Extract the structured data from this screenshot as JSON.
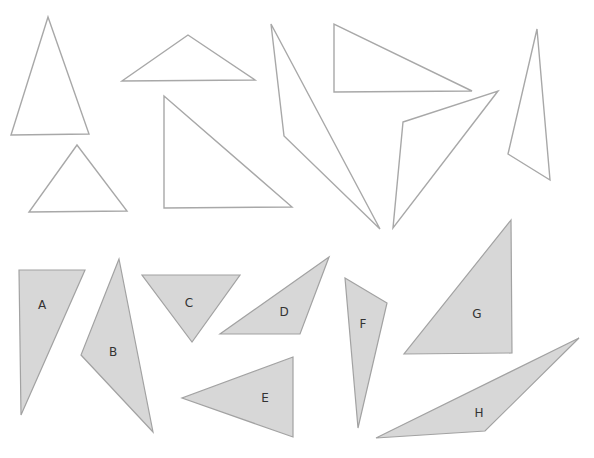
{
  "colors": {
    "background": "#ffffff",
    "outline_stroke": "#a8a8a8",
    "shape_fill": "#d7d7d7",
    "shape_stroke": "#a2a2a2",
    "label": "#333333"
  },
  "outline_triangles": [
    {
      "id": "outline-1",
      "points": "48,17 11,135 89,134"
    },
    {
      "id": "outline-2",
      "points": "77,145 29,212 127,211"
    },
    {
      "id": "outline-3",
      "points": "188,35 122,81 255,80"
    },
    {
      "id": "outline-4",
      "points": "164,96 164,208 292,207"
    },
    {
      "id": "outline-5",
      "points": "271,24 284,136 380,229"
    },
    {
      "id": "outline-6",
      "points": "334,24 334,92 472,91"
    },
    {
      "id": "outline-7",
      "points": "403,122 498,91 393,228"
    },
    {
      "id": "outline-8",
      "points": "537,29 508,154 550,180"
    }
  ],
  "labeled_triangles": [
    {
      "label": "A",
      "points": "19,270 85,270 21,415",
      "label_x": 42,
      "label_y": 305
    },
    {
      "label": "B",
      "points": "119,259 81,355 153,432",
      "label_x": 113,
      "label_y": 352
    },
    {
      "label": "C",
      "points": "142,275 240,275 192,342",
      "label_x": 189,
      "label_y": 303
    },
    {
      "label": "D",
      "points": "329,257 220,334 300,334",
      "label_x": 284,
      "label_y": 312
    },
    {
      "label": "E",
      "points": "293,357 182,398 293,437",
      "label_x": 265,
      "label_y": 398
    },
    {
      "label": "F",
      "points": "345,278 387,303 358,428",
      "label_x": 363,
      "label_y": 324
    },
    {
      "label": "G",
      "points": "511,220 404,354 512,353",
      "label_x": 477,
      "label_y": 314
    },
    {
      "label": "H",
      "points": "579,338 376,438 485,431",
      "label_x": 479,
      "label_y": 413
    }
  ]
}
